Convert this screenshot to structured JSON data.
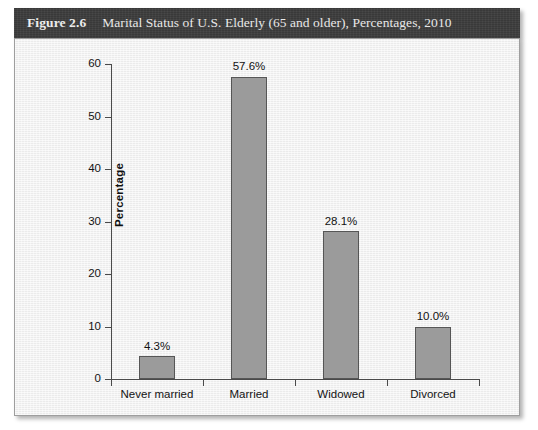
{
  "figure": {
    "number_label": "Figure 2.6",
    "title": "Marital Status of U.S. Elderly (65 and older), Percentages, 2010"
  },
  "colors": {
    "caption_bar": "#3b3b3b",
    "caption_text": "#f2f2f2",
    "panel_background": "#f1f1f1",
    "panel_border": "#9e9e9e",
    "bar_fill": "#9b9b9b",
    "bar_stroke": "#565656",
    "axis": "#4a4a4a",
    "text": "#121212"
  },
  "chart_data": {
    "type": "bar",
    "title": "Marital Status of U.S. Elderly (65 and older), Percentages, 2010",
    "categories": [
      "Never married",
      "Married",
      "Widowed",
      "Divorced"
    ],
    "values": [
      4.3,
      57.6,
      28.1,
      10.0
    ],
    "data_labels": [
      "4.3%",
      "57.6%",
      "28.1%",
      "10.0%"
    ],
    "xlabel": "",
    "ylabel": "Percentage",
    "ylim": [
      0,
      60
    ],
    "yticks": [
      0,
      10,
      20,
      30,
      40,
      50,
      60
    ],
    "ytick_labels": [
      "0",
      "10",
      "20",
      "30",
      "40",
      "50",
      "60"
    ],
    "grid": false,
    "legend": false
  }
}
